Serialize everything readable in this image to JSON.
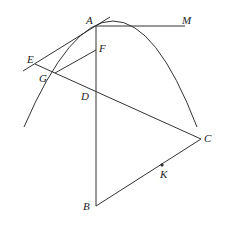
{
  "diagram": {
    "type": "geometry",
    "stroke_color": "#333333",
    "points": [
      {
        "id": "A",
        "label": "A",
        "x": 96,
        "y": 26,
        "lx": 86,
        "ly": 15
      },
      {
        "id": "M",
        "label": "M",
        "x": 185,
        "y": 26,
        "lx": 182,
        "ly": 15
      },
      {
        "id": "F",
        "label": "F",
        "x": 96,
        "y": 50,
        "lx": 99,
        "ly": 43
      },
      {
        "id": "E",
        "label": "E",
        "x": 35,
        "y": 64,
        "lx": 27,
        "ly": 54
      },
      {
        "id": "G",
        "label": "G",
        "x": 55,
        "y": 73,
        "lx": 39,
        "ly": 73
      },
      {
        "id": "D",
        "label": "D",
        "x": 96,
        "y": 91,
        "lx": 81,
        "ly": 91
      },
      {
        "id": "C",
        "label": "C",
        "x": 201,
        "y": 139,
        "lx": 204,
        "ly": 133
      },
      {
        "id": "K",
        "label": "K",
        "x": 162,
        "y": 165,
        "lx": 160,
        "ly": 169
      },
      {
        "id": "B",
        "label": "B",
        "x": 96,
        "y": 206,
        "lx": 83,
        "ly": 201
      }
    ],
    "segments": [
      {
        "from": "A",
        "to": "M"
      },
      {
        "from": "A",
        "to": "B"
      },
      {
        "from": "B",
        "to": "C"
      },
      {
        "from": "E",
        "to": "C"
      },
      {
        "from": "G",
        "to": "F"
      }
    ],
    "tangent_line": {
      "x1": 23,
      "y1": 71,
      "x2": 110,
      "y2": 17
    },
    "parabola": {
      "start": [
        24,
        127
      ],
      "vertex": [
        113,
        21
      ],
      "end": [
        197,
        127
      ]
    }
  }
}
